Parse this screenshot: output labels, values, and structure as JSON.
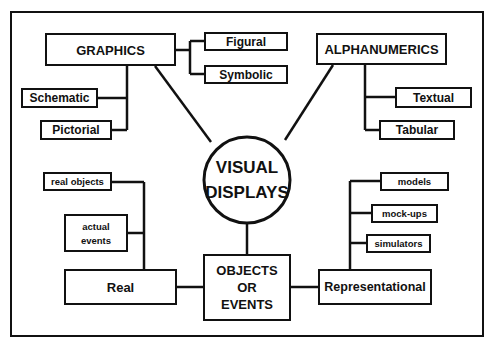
{
  "diagram": {
    "type": "concept-map",
    "center": {
      "label_line1": "VISUAL",
      "label_line2": "DISPLAYS"
    },
    "categories": {
      "graphics": {
        "label": "GRAPHICS",
        "children": [
          "Figural",
          "Symbolic",
          "Schematic",
          "Pictorial"
        ]
      },
      "alphanumerics": {
        "label": "ALPHANUMERICS",
        "children": [
          "Textual",
          "Tabular"
        ]
      },
      "objects_or_events": {
        "label_line1": "OBJECTS",
        "label_line2": "OR",
        "label_line3": "EVENTS",
        "children": [
          "Real",
          "Representational"
        ]
      }
    },
    "nodes": {
      "figural": "Figural",
      "symbolic": "Symbolic",
      "schematic": "Schematic",
      "pictorial": "Pictorial",
      "textual": "Textual",
      "tabular": "Tabular",
      "real": "Real",
      "real_objects": "real objects",
      "actual_events_line1": "actual",
      "actual_events_line2": "events",
      "representational": "Representational",
      "models": "models",
      "mock_ups": "mock-ups",
      "simulators": "simulators"
    },
    "colors": {
      "ink": "#111111",
      "background": "#ffffff"
    }
  }
}
